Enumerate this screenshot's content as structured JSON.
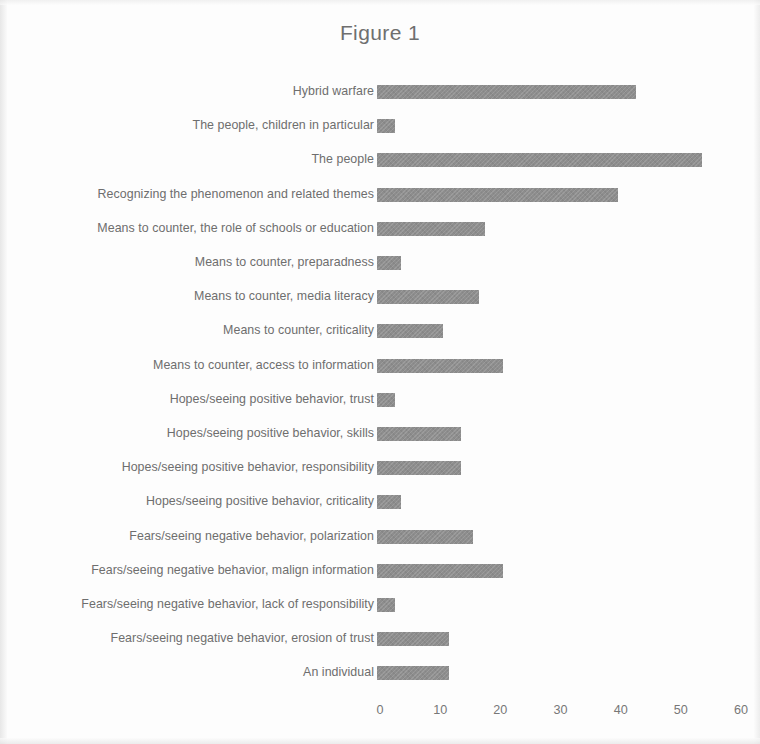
{
  "figure": {
    "title": "Figure 1",
    "bar_color": "#8d8d8d",
    "text_color": "#6e6e6e",
    "background": "#fdfdfd"
  },
  "chart_data": {
    "type": "bar",
    "orientation": "horizontal",
    "title": "Figure 1",
    "xlabel": "",
    "ylabel": "",
    "xlim": [
      0,
      60
    ],
    "xticks": [
      0,
      10,
      20,
      30,
      40,
      50,
      60
    ],
    "grid": false,
    "legend": false,
    "categories": [
      "Hybrid warfare",
      "The people, children in particular",
      "The people",
      "Recognizing the phenomenon and related themes",
      "Means to counter, the role of schools or education",
      "Means to counter, preparadness",
      "Means to counter, media literacy",
      "Means to counter, criticality",
      "Means to counter, access to information",
      "Hopes/seeing positive behavior, trust",
      "Hopes/seeing positive behavior, skills",
      "Hopes/seeing positive behavior, responsibility",
      "Hopes/seeing positive behavior, criticality",
      "Fears/seeing negative behavior, polarization",
      "Fears/seeing negative behavior, malign information",
      "Fears/seeing negative behavior, lack of responsibility",
      "Fears/seeing negative behavior, erosion of trust",
      "An individual"
    ],
    "values": [
      43,
      3,
      54,
      40,
      18,
      4,
      17,
      11,
      21,
      3,
      14,
      14,
      4,
      16,
      21,
      3,
      12,
      12
    ]
  }
}
